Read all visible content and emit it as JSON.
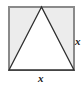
{
  "figure": {
    "canvas": {
      "width": 84,
      "height": 88,
      "background": "#ffffff"
    },
    "square": {
      "name": "square",
      "x": 9,
      "y": 7,
      "width": 65,
      "height": 63,
      "fill": "#ececec",
      "stroke": "#8a8a8a",
      "stroke_width": 1.6
    },
    "triangle": {
      "name": "inscribed-triangle",
      "points": "41.5,7 9,70 74,70",
      "apex": {
        "x": 41.5,
        "y": 7
      },
      "base_left": {
        "x": 9,
        "y": 70
      },
      "base_right": {
        "x": 74,
        "y": 70
      },
      "fill": "#ffffff",
      "stroke": "#2e2e2e",
      "stroke_width": 1.3
    },
    "labels": {
      "right": "x",
      "bottom": "x"
    }
  }
}
